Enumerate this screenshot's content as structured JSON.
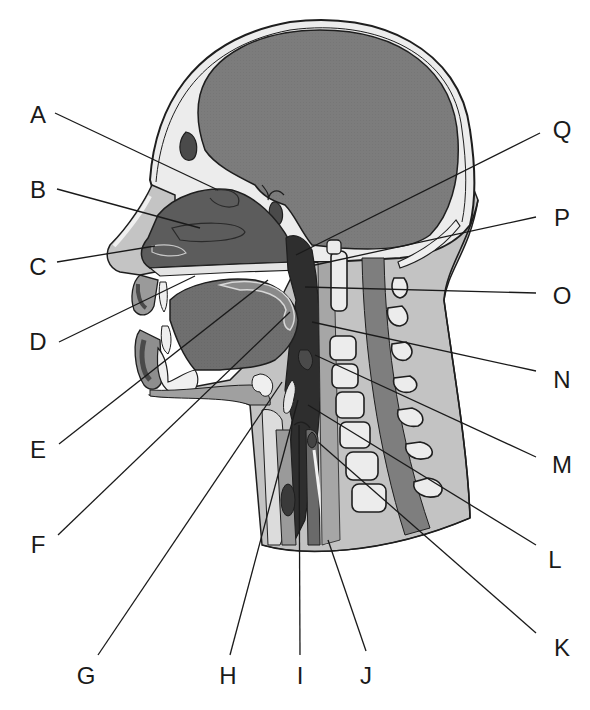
{
  "diagram": {
    "colors": {
      "background": "#ffffff",
      "brain": "#7a7a7a",
      "skull_bone": "#ebebeb",
      "outline": "#1e1e1e",
      "soft_tissue": "#b4b4b4",
      "dark_cavity": "#2e2e2e",
      "nasal_cavity": "#5a5a5a",
      "tongue": "#6e6e6e",
      "vertebra": "#ececec",
      "spinal_cord": "#7d7d7d",
      "leader_line": "#1a1a1a"
    },
    "labels": [
      {
        "id": "A",
        "text": "A",
        "x": 38,
        "y": 115,
        "lx1": 55,
        "ly1": 113,
        "lx2": 218,
        "ly2": 190
      },
      {
        "id": "B",
        "text": "B",
        "x": 38,
        "y": 190,
        "lx1": 57,
        "ly1": 189,
        "lx2": 200,
        "ly2": 228
      },
      {
        "id": "C",
        "text": "C",
        "x": 38,
        "y": 267,
        "lx1": 57,
        "ly1": 262,
        "lx2": 155,
        "ly2": 246
      },
      {
        "id": "D",
        "text": "D",
        "x": 38,
        "y": 342,
        "lx1": 59,
        "ly1": 342,
        "lx2": 195,
        "ly2": 276
      },
      {
        "id": "E",
        "text": "E",
        "x": 38,
        "y": 450,
        "lx1": 59,
        "ly1": 444,
        "lx2": 268,
        "ly2": 280
      },
      {
        "id": "F",
        "text": "F",
        "x": 38,
        "y": 545,
        "lx1": 58,
        "ly1": 535,
        "lx2": 290,
        "ly2": 312
      },
      {
        "id": "G",
        "text": "G",
        "x": 86,
        "y": 676,
        "lx1": 98,
        "ly1": 655,
        "lx2": 282,
        "ly2": 382
      },
      {
        "id": "H",
        "text": "H",
        "x": 228,
        "y": 676,
        "lx1": 230,
        "ly1": 655,
        "lx2": 298,
        "ly2": 400
      },
      {
        "id": "I",
        "text": "I",
        "x": 300,
        "y": 676,
        "lx1": 300,
        "ly1": 655,
        "lx2": 299,
        "ly2": 425
      },
      {
        "id": "J",
        "text": "J",
        "x": 366,
        "y": 676,
        "lx1": 366,
        "ly1": 651,
        "lx2": 328,
        "ly2": 540
      },
      {
        "id": "K",
        "text": "K",
        "x": 562,
        "y": 648,
        "lx1": 536,
        "ly1": 633,
        "lx2": 318,
        "ly2": 442
      },
      {
        "id": "L",
        "text": "L",
        "x": 555,
        "y": 560,
        "lx1": 536,
        "ly1": 545,
        "lx2": 308,
        "ly2": 405
      },
      {
        "id": "M",
        "text": "M",
        "x": 562,
        "y": 465,
        "lx1": 536,
        "ly1": 457,
        "lx2": 315,
        "ly2": 355
      },
      {
        "id": "N",
        "text": "N",
        "x": 562,
        "y": 380,
        "lx1": 536,
        "ly1": 371,
        "lx2": 312,
        "ly2": 322
      },
      {
        "id": "O",
        "text": "O",
        "x": 562,
        "y": 296,
        "lx1": 536,
        "ly1": 293,
        "lx2": 305,
        "ly2": 287
      },
      {
        "id": "P",
        "text": "P",
        "x": 562,
        "y": 218,
        "lx1": 536,
        "ly1": 217,
        "lx2": 315,
        "ly2": 265
      },
      {
        "id": "Q",
        "text": "Q",
        "x": 562,
        "y": 130,
        "lx1": 540,
        "ly1": 133,
        "lx2": 296,
        "ly2": 255
      }
    ]
  }
}
